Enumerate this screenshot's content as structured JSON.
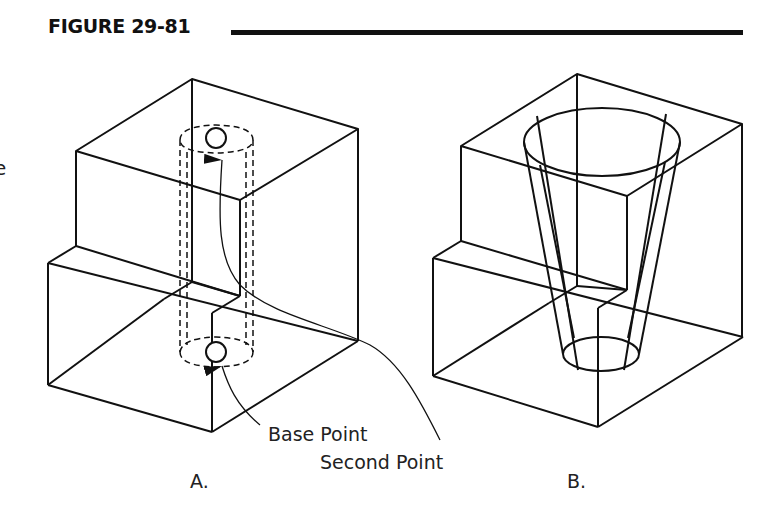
{
  "figure": {
    "title": "FIGURE 29-81",
    "edge_fragment": "e",
    "colors": {
      "ink": "#111111",
      "background": "#ffffff"
    }
  },
  "panel_a": {
    "label": "A.",
    "callouts": [
      {
        "text": "Base Point"
      },
      {
        "text": "Second Point"
      }
    ]
  },
  "panel_b": {
    "label": "B."
  }
}
